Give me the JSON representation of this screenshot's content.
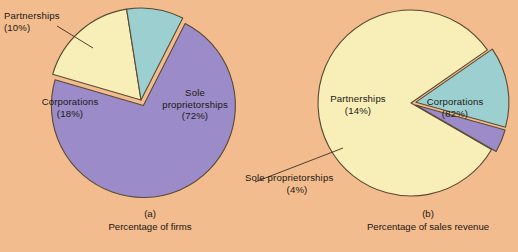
{
  "figure": {
    "background_color": "#f2bc8e",
    "outline_color": "#5a4a32"
  },
  "chart_data": [
    {
      "type": "pie",
      "title": "Percentage of firms",
      "panel_tag": "(a)",
      "categories": [
        "Sole proprietorships",
        "Corporations",
        "Partnerships"
      ],
      "values": [
        72,
        18,
        10
      ],
      "labels": [
        "Sole proprietorships\n(72%)",
        "Corporations\n(18%)",
        "Partnerships\n(10%)"
      ],
      "colors": [
        "#9b8bc8",
        "#f7eeb8",
        "#9ccfcf"
      ],
      "exploded": [
        "Sole proprietorships"
      ],
      "units": "percent",
      "legend": "none",
      "leader_lines": [
        "Partnerships"
      ]
    },
    {
      "type": "pie",
      "title": "Percentage of sales revenue",
      "panel_tag": "(b)",
      "categories": [
        "Corporations",
        "Partnerships",
        "Sole proprietorships"
      ],
      "values": [
        82,
        14,
        4
      ],
      "labels": [
        "Corporations\n(82%)",
        "Partnerships\n(14%)",
        "Sole proprietorships\n(4%)"
      ],
      "colors": [
        "#f7eeb8",
        "#9ccfcf",
        "#9b8bc8"
      ],
      "exploded": [
        "Partnerships",
        "Sole proprietorships"
      ],
      "units": "percent",
      "legend": "none",
      "leader_lines": [
        "Sole proprietorships"
      ]
    }
  ],
  "panel_a": {
    "tag": "(a)",
    "caption": "Percentage of firms",
    "partnerships_label_line1": "Partnerships",
    "partnerships_label_line2": "(10%)",
    "corporations_label_line1": "Corporations",
    "corporations_label_line2": "(18%)",
    "sole_label_line1": "Sole",
    "sole_label_line2": "proprietorships",
    "sole_label_line3": "(72%)"
  },
  "panel_b": {
    "tag": "(b)",
    "caption": "Percentage of sales revenue",
    "partnerships_label_line1": "Partnerships",
    "partnerships_label_line2": "(14%)",
    "corporations_label_line1": "Corporations",
    "corporations_label_line2": "(82%)",
    "sole_label_line1": "Sole proprietorships",
    "sole_label_line2": "(4%)"
  }
}
